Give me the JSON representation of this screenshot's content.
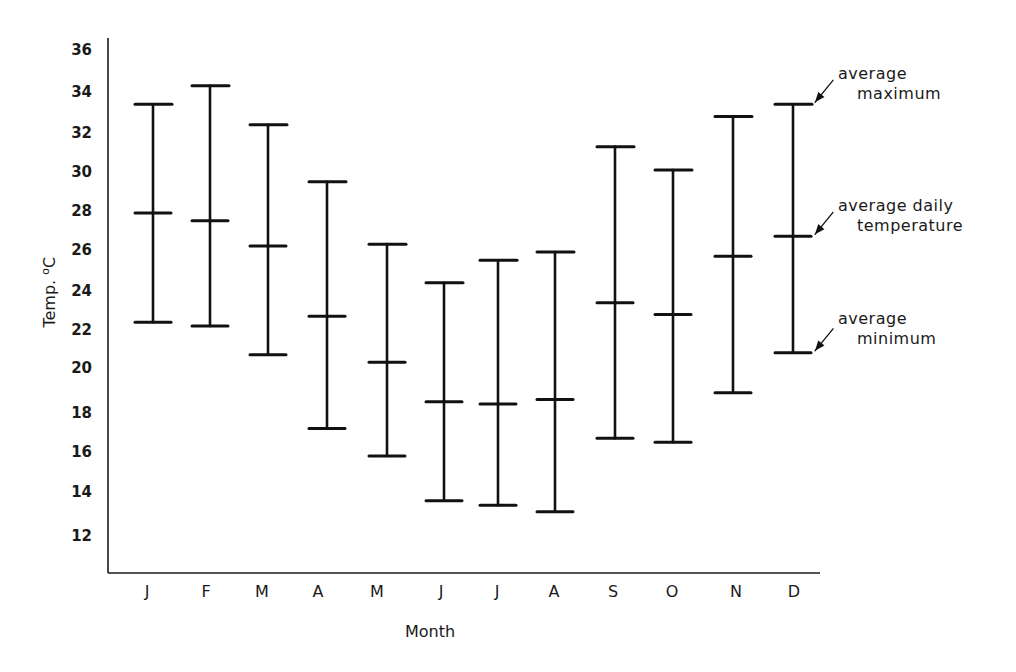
{
  "chart_data": {
    "type": "errorbar",
    "title": "",
    "xlabel": "Month",
    "ylabel": "Temp. °C",
    "ylabel_parts": {
      "text": "Temp. ",
      "unit_sup": "o",
      "unit": "C"
    },
    "ylim": [
      11,
      37
    ],
    "yticks": [
      12,
      14,
      16,
      18,
      20,
      22,
      24,
      26,
      28,
      30,
      32,
      34,
      36
    ],
    "grid": false,
    "categories": [
      "J",
      "F",
      "M",
      "A",
      "M",
      "J",
      "J",
      "A",
      "S",
      "O",
      "N",
      "D"
    ],
    "series": [
      {
        "name": "average maximum",
        "values": [
          33.4,
          34.3,
          32.4,
          29.5,
          26.3,
          24.4,
          25.5,
          25.9,
          31.3,
          30.1,
          32.8,
          33.4
        ]
      },
      {
        "name": "average daily temperature",
        "values": [
          27.9,
          27.5,
          26.2,
          22.7,
          20.3,
          18.5,
          18.4,
          18.6,
          23.4,
          22.8,
          25.7,
          26.7
        ]
      },
      {
        "name": "average minimum",
        "values": [
          22.4,
          22.2,
          20.7,
          17.2,
          15.8,
          13.6,
          13.4,
          13.1,
          16.7,
          16.5,
          18.9,
          20.8
        ]
      }
    ],
    "annotations": [
      {
        "text_line1": "average",
        "text_line2": "maximum",
        "points_to": "D average maximum"
      },
      {
        "text_line1": "average daily",
        "text_line2": "temperature",
        "points_to": "D average daily temperature"
      },
      {
        "text_line1": "average",
        "text_line2": "minimum",
        "points_to": "D average minimum"
      }
    ]
  }
}
